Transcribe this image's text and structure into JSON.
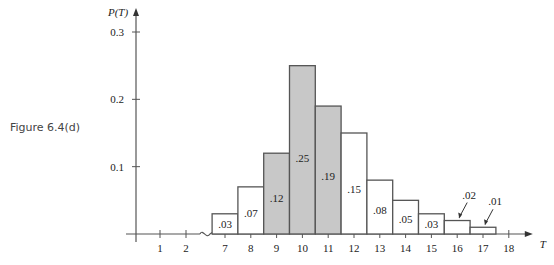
{
  "figure_label": "Figure 6.4(d)",
  "chart_data": {
    "type": "bar",
    "title": "",
    "xlabel": "T",
    "ylabel": "P(T)",
    "ylim": [
      0,
      0.3
    ],
    "yticks": [
      0.1,
      0.2,
      0.3
    ],
    "ytick_labels": [
      "0.1",
      "0.2",
      "0.3"
    ],
    "axis_break_between": [
      2,
      7
    ],
    "xticks_before_break": [
      "1",
      "2"
    ],
    "categories": [
      "7",
      "8",
      "9",
      "10",
      "11",
      "12",
      "13",
      "14",
      "15",
      "16",
      "17",
      "18"
    ],
    "values": [
      0.03,
      0.07,
      0.12,
      0.25,
      0.19,
      0.15,
      0.08,
      0.05,
      0.03,
      0.02,
      0.01,
      0
    ],
    "data_labels": [
      ".03",
      ".07",
      ".12",
      ".25",
      ".19",
      ".15",
      ".08",
      ".05",
      ".03",
      ".02",
      ".01",
      ""
    ],
    "shaded_categories": [
      "9",
      "10",
      "11"
    ],
    "callout_labels": [
      "16",
      "17"
    ],
    "grid": false,
    "legend": "none",
    "colors": {
      "shaded": "#c8c8c8",
      "unshaded": "#ffffff",
      "stroke": "#555555",
      "text": "#222222"
    }
  }
}
